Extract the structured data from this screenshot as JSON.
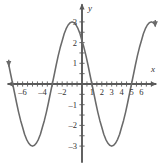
{
  "chart_data": {
    "type": "line",
    "title": "",
    "subtitle": "",
    "xlabel": "x",
    "ylabel": "y",
    "function": "y = 3cos(pi*x/2)",
    "amplitude": 3,
    "period": 4,
    "xlim": [
      -7.4,
      7.4
    ],
    "ylim": [
      -3.6,
      3.6
    ],
    "grid": false,
    "legend": null,
    "axis_arrows": {
      "x_positive": true,
      "x_negative": true,
      "y_positive": true,
      "y_negative": true
    },
    "curve_end_arrows": {
      "left": "down",
      "right": "down"
    },
    "x_tick_values": [
      -7,
      -6.5,
      -6,
      -5.5,
      -5,
      -4.5,
      -4,
      -3.5,
      -3,
      -2.5,
      -2,
      -1.5,
      -1,
      -0.5,
      0.5,
      1,
      1.5,
      2,
      2.5,
      3,
      3.5,
      4,
      4.5,
      5,
      5.5,
      6,
      6.5,
      7
    ],
    "y_tick_values": [
      -3,
      -2.5,
      -2,
      -1.5,
      -1,
      -0.5,
      0.5,
      1,
      1.5,
      2,
      2.5,
      3
    ],
    "x_tick_labels": [
      {
        "value": -6,
        "text": "–6"
      },
      {
        "value": -4,
        "text": "–4"
      },
      {
        "value": -2,
        "text": "–2"
      },
      {
        "value": 1,
        "text": "1"
      },
      {
        "value": 2,
        "text": "2"
      },
      {
        "value": 3,
        "text": "3"
      },
      {
        "value": 4,
        "text": "4"
      },
      {
        "value": 5,
        "text": "5"
      },
      {
        "value": 6,
        "text": "6"
      }
    ],
    "y_tick_labels": [
      {
        "value": 3,
        "text": "3"
      },
      {
        "value": 2,
        "text": "2"
      },
      {
        "value": 1,
        "text": "1"
      },
      {
        "value": -1,
        "text": "–1"
      },
      {
        "value": -2,
        "text": "–2"
      },
      {
        "value": -3,
        "text": "–3"
      }
    ],
    "maxima": [
      {
        "x": -6,
        "y": 3
      },
      {
        "x": -2,
        "y": 3
      },
      {
        "x": 2,
        "y": 3
      },
      {
        "x": 6,
        "y": 3
      }
    ],
    "minima": [
      {
        "x": -4,
        "y": -3
      },
      {
        "x": 0,
        "y": -3
      },
      {
        "x": 4,
        "y": -3
      }
    ],
    "x_intercepts": [
      -7,
      -5,
      -3,
      -1,
      1,
      3,
      5,
      7
    ],
    "series": [
      {
        "name": "y = 3cos(pi*x/2)",
        "color": "#6a6a6a",
        "x": [
          -7.4,
          -7.2,
          -7,
          -6.8,
          -6.6,
          -6.4,
          -6.2,
          -6,
          -5.8,
          -5.6,
          -5.4,
          -5.2,
          -5,
          -4.8,
          -4.6,
          -4.4,
          -4.2,
          -4,
          -3.8,
          -3.6,
          -3.4,
          -3.2,
          -3,
          -2.8,
          -2.6,
          -2.4,
          -2.2,
          -2,
          -1.8,
          -1.6,
          -1.4,
          -1.2,
          -1,
          -0.8,
          -0.6,
          -0.4,
          -0.2,
          0,
          0.2,
          0.4,
          0.6,
          0.8,
          1,
          1.2,
          1.4,
          1.6,
          1.8,
          2,
          2.2,
          2.4,
          2.6,
          2.8,
          3,
          3.2,
          3.4,
          3.6,
          3.8,
          4,
          4.2,
          4.4,
          4.6,
          4.8,
          5,
          5.2,
          5.4,
          5.6,
          5.8,
          6,
          6.2,
          6.4,
          6.6,
          6.8,
          7,
          7.2,
          7.4
        ],
        "y": [
          0.93,
          0.46,
          0,
          -0.46,
          -0.93,
          -1.37,
          -1.76,
          -2.09,
          -2.43,
          -2.67,
          -2.85,
          -2.96,
          -3,
          -2.96,
          -2.85,
          -2.67,
          -2.43,
          -2.09,
          -1.76,
          -1.37,
          -0.93,
          -0.46,
          0,
          0.46,
          0.93,
          1.37,
          1.76,
          2.09,
          2.43,
          2.67,
          2.85,
          2.96,
          3,
          2.96,
          2.85,
          2.67,
          2.43,
          2.09,
          1.76,
          1.37,
          0.93,
          0.46,
          0,
          -0.46,
          -0.93,
          -1.37,
          -1.76,
          -2.09,
          -2.43,
          -2.67,
          -2.85,
          -2.96,
          -3,
          -2.96,
          -2.85,
          -2.67,
          -2.43,
          -2.09,
          -1.76,
          -1.37,
          -0.93,
          -0.46,
          0,
          0.46,
          0.93,
          1.37,
          1.76,
          2.09,
          2.43,
          2.67,
          2.85,
          2.96,
          3,
          2.96,
          2.85
        ]
      }
    ],
    "colors": {
      "curve": "#6a6a6a",
      "axis": "#5a5a5a",
      "tick": "#5a5a5a",
      "text": "#333333",
      "background": "#ffffff"
    }
  }
}
